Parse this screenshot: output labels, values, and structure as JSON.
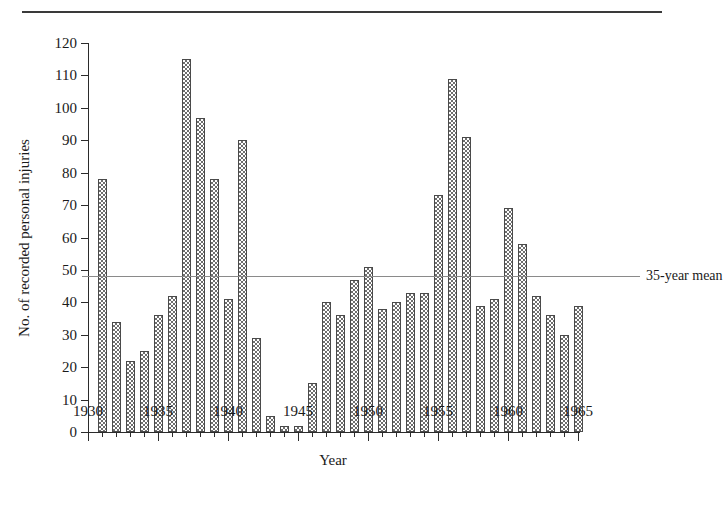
{
  "chart_data": {
    "type": "bar",
    "title": "",
    "xlabel": "Year",
    "ylabel": "No. of recorded personal injuries",
    "xlim": [
      1930,
      1965
    ],
    "ylim": [
      0,
      120
    ],
    "y_ticks": [
      0,
      10,
      20,
      30,
      40,
      50,
      60,
      70,
      80,
      90,
      100,
      110,
      120
    ],
    "x_ticks": [
      1930,
      1935,
      1940,
      1945,
      1950,
      1955,
      1960,
      1965
    ],
    "x_tick_labels": [
      "1930",
      "1935",
      "1940",
      "1945",
      "1950",
      "1955",
      "1960",
      "1965"
    ],
    "x_minor_tick_step": 1,
    "grid": false,
    "legend_position": "right-inline",
    "categories": [
      1931,
      1932,
      1933,
      1934,
      1935,
      1936,
      1937,
      1938,
      1939,
      1940,
      1941,
      1942,
      1943,
      1944,
      1945,
      1946,
      1947,
      1948,
      1949,
      1950,
      1951,
      1952,
      1953,
      1954,
      1955,
      1956,
      1957,
      1958,
      1959,
      1960,
      1961,
      1962,
      1963,
      1964,
      1965
    ],
    "values": [
      78,
      34,
      22,
      25,
      36,
      42,
      115,
      97,
      78,
      41,
      90,
      29,
      5,
      2,
      2,
      15,
      40,
      36,
      47,
      51,
      38,
      40,
      43,
      43,
      73,
      109,
      91,
      39,
      41,
      69,
      58,
      42,
      36,
      30,
      39
    ],
    "annotations": [
      {
        "name": "mean-line",
        "label": "35-year mean",
        "value": 48,
        "style": "horizontal-line",
        "color": "#8a8a8a"
      }
    ]
  },
  "axis": {
    "y_title": "No. of recorded personal injuries",
    "x_title": "Year"
  },
  "mean": {
    "label": "35-year mean",
    "value": 48
  },
  "colors": {
    "bar_fill": "#6e6e6e",
    "bar_border": "#4a4a4a",
    "axis": "#2b2b2b",
    "mean_line": "#8a8a8a",
    "rule": "#3a3a3a",
    "background": "#ffffff"
  }
}
